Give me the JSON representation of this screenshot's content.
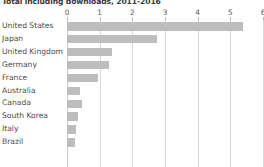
{
  "chart": {
    "title": "Total including downloads, 2011-2016"
  },
  "chart_data": {
    "type": "bar",
    "orientation": "horizontal",
    "title": "Total including downloads, 2011-2016",
    "xlabel": "",
    "ylabel": "",
    "categories": [
      "United States",
      "Japan",
      "United Kingdom",
      "Germany",
      "France",
      "Australia",
      "Canada",
      "South Korea",
      "Italy",
      "Brazil"
    ],
    "values": [
      5.4,
      2.75,
      1.38,
      1.28,
      0.95,
      0.4,
      0.46,
      0.34,
      0.28,
      0.25
    ],
    "xlim": [
      0,
      6
    ],
    "xticks": [
      0,
      1,
      2,
      3,
      4,
      5,
      6
    ],
    "xtick_labels": [
      "0",
      "1",
      "2",
      "3",
      "4",
      "5",
      "6"
    ],
    "grid": true,
    "legend": false,
    "bar_color": "#bdbdbd",
    "series": [
      {
        "name": "Total including downloads",
        "values": [
          5.4,
          2.75,
          1.38,
          1.28,
          0.95,
          0.4,
          0.46,
          0.34,
          0.28,
          0.25
        ]
      }
    ]
  }
}
